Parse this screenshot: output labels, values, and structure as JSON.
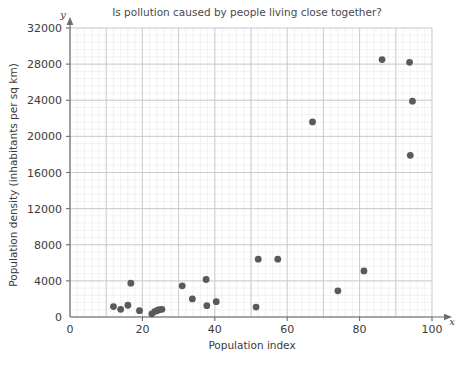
{
  "chart_data": {
    "type": "scatter",
    "title": "Is pollution caused by people living close together?",
    "xlabel": "Population index",
    "ylabel": "Population density (inhabitants per sq km)",
    "x_axis_letter": "x",
    "y_axis_letter": "y",
    "xlim": [
      0,
      100
    ],
    "ylim": [
      0,
      32000
    ],
    "x_ticks": [
      0,
      20,
      40,
      60,
      80,
      100
    ],
    "x_tick_labels": [
      "0",
      "20",
      "40",
      "60",
      "80",
      "100"
    ],
    "y_ticks": [
      0,
      4000,
      8000,
      12000,
      16000,
      20000,
      24000,
      28000,
      32000
    ],
    "y_tick_labels": [
      "0",
      "4000",
      "8000",
      "12000",
      "16000",
      "20000",
      "24000",
      "28000",
      "32000"
    ],
    "x_major_step": 10,
    "y_major_step": 4000,
    "x_minor_step": 2,
    "y_minor_step": 800,
    "grid": true,
    "legend": "none",
    "point_color": "#5a5a5a",
    "point_radius": 3.4,
    "points": [
      {
        "x": 12.0,
        "y": 1150
      },
      {
        "x": 14.0,
        "y": 850
      },
      {
        "x": 16.0,
        "y": 1300
      },
      {
        "x": 16.8,
        "y": 3750
      },
      {
        "x": 19.2,
        "y": 700
      },
      {
        "x": 22.6,
        "y": 350
      },
      {
        "x": 23.4,
        "y": 600
      },
      {
        "x": 24.0,
        "y": 700
      },
      {
        "x": 24.6,
        "y": 800
      },
      {
        "x": 25.4,
        "y": 850
      },
      {
        "x": 31.0,
        "y": 3450
      },
      {
        "x": 33.8,
        "y": 2000
      },
      {
        "x": 37.6,
        "y": 4150
      },
      {
        "x": 37.8,
        "y": 1250
      },
      {
        "x": 40.4,
        "y": 1700
      },
      {
        "x": 51.4,
        "y": 1100
      },
      {
        "x": 52.0,
        "y": 6400
      },
      {
        "x": 57.4,
        "y": 6400
      },
      {
        "x": 67.0,
        "y": 21600
      },
      {
        "x": 74.0,
        "y": 2900
      },
      {
        "x": 81.2,
        "y": 5100
      },
      {
        "x": 86.2,
        "y": 28500
      },
      {
        "x": 93.8,
        "y": 28200
      },
      {
        "x": 94.6,
        "y": 23900
      },
      {
        "x": 94.0,
        "y": 17900
      }
    ]
  }
}
